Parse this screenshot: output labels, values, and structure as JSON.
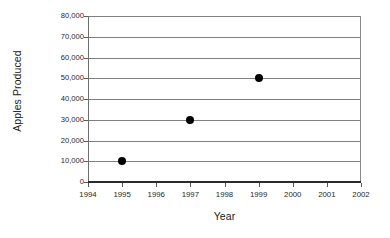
{
  "chart_data": {
    "type": "scatter",
    "title": "",
    "xlabel": "Year",
    "ylabel": "Apples Produced",
    "x": [
      1995,
      1997,
      1999
    ],
    "values": [
      10000,
      30000,
      50000
    ],
    "points": [
      {
        "x": 1995,
        "y": 10000,
        "y_label": "10,000"
      },
      {
        "x": 1997,
        "y": 30000,
        "y_label": "30,000"
      },
      {
        "x": 1999,
        "y": 50000,
        "y_label": "50,000"
      }
    ],
    "xlim": [
      1994,
      2002
    ],
    "ylim": [
      0,
      80000
    ],
    "x_tick_labels": [
      "1994",
      "1995",
      "1996",
      "1997",
      "1998",
      "1999",
      "2000",
      "2001",
      "2002"
    ],
    "x_ticks": [
      1994,
      1995,
      1996,
      1997,
      1998,
      1999,
      2000,
      2001,
      2002
    ],
    "y_tick_labels": [
      "80,000",
      "70,000",
      "60,000",
      "50,000",
      "40,000",
      "30,000",
      "20,000",
      "10,000",
      "0"
    ],
    "y_ticks": [
      80000,
      70000,
      60000,
      50000,
      40000,
      30000,
      20000,
      10000,
      0
    ],
    "grid": "horizontal",
    "legend": null,
    "legend_position": "none",
    "marker": "filled-circle",
    "marker_color": "#000000",
    "gridline_color": "#808080",
    "axis_color": "#2b2b2b",
    "background_color": "#ffffff"
  }
}
